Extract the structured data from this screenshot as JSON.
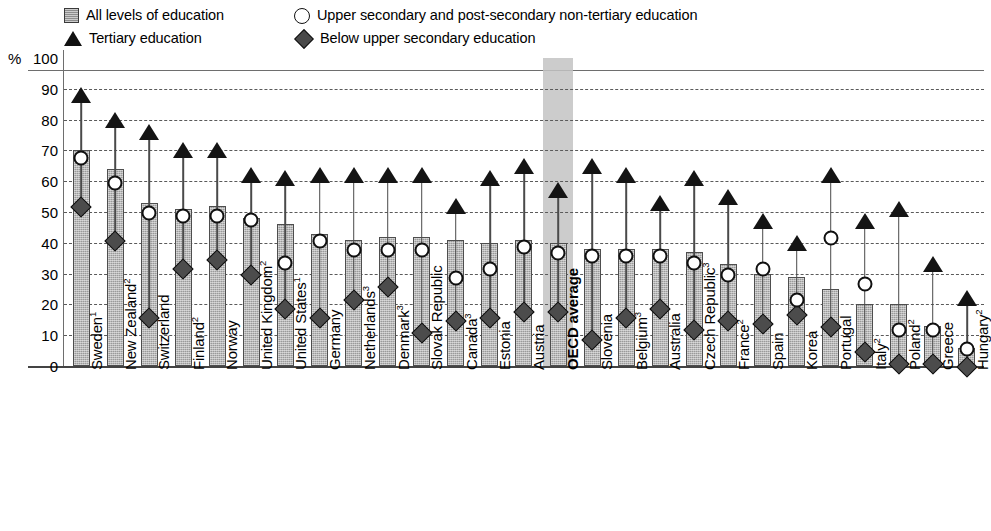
{
  "legend": {
    "items": [
      {
        "icon": "square-swatch",
        "label": "All levels of education"
      },
      {
        "icon": "circle-swatch",
        "label": "Upper secondary and post-secondary non-tertiary education"
      },
      {
        "icon": "triangle-swatch",
        "label": "Tertiary education"
      },
      {
        "icon": "diamond-swatch",
        "label": "Below upper secondary education"
      }
    ]
  },
  "axis": {
    "unit_label": "%",
    "yticks": [
      "100",
      "90",
      "80",
      "70",
      "60",
      "50",
      "40",
      "30",
      "20",
      "10",
      "0"
    ]
  },
  "highlight": {
    "category": "OECD average",
    "color": "#c3c3c3"
  },
  "chart_data": {
    "type": "bar",
    "title": "",
    "xlabel": "",
    "ylabel": "%",
    "ylim": [
      0,
      100
    ],
    "ytick_step": 10,
    "grid": true,
    "legend_position": "top",
    "categories": [
      "Sweden",
      "New Zealand",
      "Switzerland",
      "Finland",
      "Norway",
      "United Kingdom",
      "United States",
      "Germany",
      "Netherlands",
      "Denmark",
      "Slovak Republic",
      "Canada",
      "Estonia",
      "Austria",
      "OECD average",
      "Slovenia",
      "Belgium",
      "Australia",
      "Czech Republic",
      "France",
      "Spain",
      "Korea",
      "Portugal",
      "Italy",
      "Poland",
      "Greece",
      "Hungary"
    ],
    "category_notes": {
      "Sweden": "1",
      "New Zealand": "2",
      "Finland": "2",
      "United Kingdom": "2",
      "United States": "1",
      "Netherlands": "3",
      "Denmark": "3",
      "Canada": "3",
      "Belgium": "3",
      "Czech Republic": "3",
      "France": "2",
      "Italy": "2",
      "Poland": "2",
      "Hungary": "2"
    },
    "series": [
      {
        "name": "All levels of education",
        "marker": "bar",
        "values": [
          70,
          64,
          53,
          51,
          52,
          48,
          46,
          43,
          41,
          42,
          42,
          41,
          40,
          41,
          40,
          38,
          38,
          38,
          37,
          33,
          30,
          29,
          25,
          20,
          20,
          13,
          6
        ]
      },
      {
        "name": "Tertiary education",
        "marker": "triangle",
        "values": [
          88,
          80,
          76,
          70,
          70,
          62,
          61,
          62,
          62,
          62,
          62,
          52,
          61,
          65,
          57,
          65,
          62,
          53,
          61,
          55,
          47,
          40,
          62,
          47,
          51,
          33,
          22
        ]
      },
      {
        "name": "Upper secondary and post-secondary non-tertiary education",
        "marker": "circle",
        "values": [
          70,
          62,
          52,
          51,
          51,
          50,
          36,
          43,
          40,
          40,
          40,
          31,
          34,
          41,
          39,
          38,
          38,
          38,
          36,
          32,
          34,
          24,
          44,
          29,
          14,
          14,
          8
        ]
      },
      {
        "name": "Below upper secondary education",
        "marker": "diamond",
        "values": [
          54,
          43,
          18,
          34,
          37,
          32,
          21,
          18,
          24,
          28,
          13,
          17,
          18,
          20,
          20,
          11,
          18,
          21,
          14,
          17,
          16,
          19,
          15,
          7,
          3,
          3,
          2
        ]
      }
    ]
  }
}
